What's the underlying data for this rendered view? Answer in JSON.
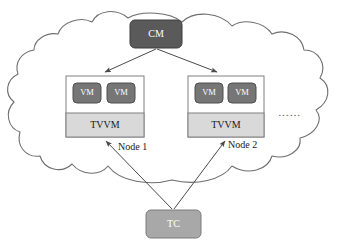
{
  "diagram": {
    "type": "architecture-diagram",
    "canvas": {
      "width": 349,
      "height": 251,
      "background": "#ffffff"
    },
    "colors": {
      "cloud_outline": "#6e6e6e",
      "cm_fill": "#5a5a5a",
      "vm_fill": "#767676",
      "tc_fill": "#a8a8a8",
      "tvvm_fill": "#d9d9d9",
      "node_fill": "#ffffff",
      "node_border": "#808080",
      "arrow": "#4a4a4a",
      "text_dark": "#1a1a1a",
      "text_light": "#ffffff"
    },
    "cloud": {
      "name": "cloud-boundary"
    },
    "cm": {
      "label": "CM",
      "x": 130,
      "y": 20,
      "width": 52,
      "height": 28
    },
    "tc": {
      "label": "TC",
      "x": 146,
      "y": 210,
      "width": 55,
      "height": 28
    },
    "nodes": [
      {
        "id": "node-1",
        "caption": "Node 1",
        "x": 66,
        "y": 76,
        "width": 78,
        "height": 61,
        "tvvm_label": "TVVM",
        "vms": [
          {
            "label": "VM"
          },
          {
            "label": "VM"
          }
        ]
      },
      {
        "id": "node-2",
        "caption": "Node 2",
        "x": 188,
        "y": 76,
        "width": 76,
        "height": 61,
        "tvvm_label": "TVVM",
        "vms": [
          {
            "label": "VM"
          },
          {
            "label": "VM"
          }
        ]
      }
    ],
    "ellipsis": {
      "label": "……",
      "x": 278,
      "y": 113
    },
    "edges": [
      {
        "id": "cm-to-node1",
        "from": "CM",
        "to": "Node 1",
        "arrow": true
      },
      {
        "id": "cm-to-node2",
        "from": "CM",
        "to": "Node 2",
        "arrow": true
      },
      {
        "id": "tc-to-node1",
        "from": "TC",
        "to": "Node 1",
        "arrow": true
      },
      {
        "id": "tc-to-node2",
        "from": "TC",
        "to": "Node 2",
        "arrow": true
      }
    ]
  }
}
